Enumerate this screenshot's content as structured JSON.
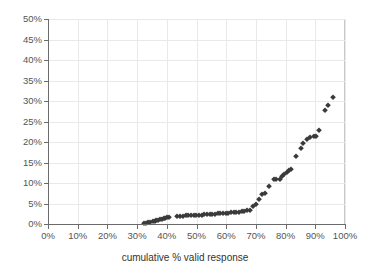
{
  "chart_data": {
    "type": "scatter",
    "title": "",
    "xlabel": "cumulative % valid response",
    "ylabel": "",
    "xlim": [
      0,
      100
    ],
    "ylim": [
      0,
      50
    ],
    "grid": true,
    "legend": null,
    "marker_style": "diamond",
    "marker_color": "#3a3a3a",
    "x_tick_labels": [
      "0%",
      "10%",
      "20%",
      "30%",
      "40%",
      "50%",
      "60%",
      "70%",
      "80%",
      "90%",
      "100%"
    ],
    "x_ticks": [
      0,
      10,
      20,
      30,
      40,
      50,
      60,
      70,
      80,
      90,
      100
    ],
    "y_tick_labels": [
      "0%",
      "5%",
      "10%",
      "15%",
      "20%",
      "25%",
      "30%",
      "35%",
      "40%",
      "45%",
      "50%"
    ],
    "y_ticks": [
      0,
      5,
      10,
      15,
      20,
      25,
      30,
      35,
      40,
      45,
      50
    ],
    "points": [
      [
        32.2,
        0.15
      ],
      [
        33.0,
        0.35
      ],
      [
        33.8,
        0.5
      ],
      [
        34.5,
        0.6
      ],
      [
        35.2,
        0.7
      ],
      [
        35.9,
        0.8
      ],
      [
        36.5,
        0.9
      ],
      [
        37.1,
        1.0
      ],
      [
        37.7,
        1.1
      ],
      [
        38.3,
        1.25
      ],
      [
        38.9,
        1.35
      ],
      [
        39.5,
        1.5
      ],
      [
        40.1,
        1.6
      ],
      [
        40.7,
        1.75
      ],
      [
        43.6,
        1.95
      ],
      [
        44.5,
        2.0
      ],
      [
        45.4,
        2.05
      ],
      [
        46.3,
        2.1
      ],
      [
        47.2,
        2.1
      ],
      [
        48.1,
        2.15
      ],
      [
        49.0,
        2.2
      ],
      [
        49.9,
        2.25
      ],
      [
        50.8,
        2.3
      ],
      [
        51.7,
        2.3
      ],
      [
        52.6,
        2.35
      ],
      [
        53.5,
        2.4
      ],
      [
        54.4,
        2.45
      ],
      [
        55.3,
        2.5
      ],
      [
        56.2,
        2.55
      ],
      [
        57.1,
        2.6
      ],
      [
        58.0,
        2.65
      ],
      [
        58.9,
        2.7
      ],
      [
        59.8,
        2.75
      ],
      [
        60.7,
        2.8
      ],
      [
        61.6,
        2.85
      ],
      [
        62.5,
        2.9
      ],
      [
        63.4,
        2.95
      ],
      [
        64.3,
        3.0
      ],
      [
        65.2,
        3.1
      ],
      [
        66.1,
        3.2
      ],
      [
        67.0,
        3.3
      ],
      [
        67.9,
        3.5
      ],
      [
        69.0,
        4.3
      ],
      [
        70.0,
        5.0
      ],
      [
        71.2,
        6.1
      ],
      [
        72.2,
        7.2
      ],
      [
        72.9,
        7.5
      ],
      [
        74.5,
        9.3
      ],
      [
        76.0,
        10.9
      ],
      [
        76.9,
        11.0
      ],
      [
        78.0,
        11.0
      ],
      [
        78.8,
        11.7
      ],
      [
        79.6,
        12.1
      ],
      [
        80.4,
        12.7
      ],
      [
        81.2,
        13.2
      ],
      [
        81.9,
        13.4
      ],
      [
        83.4,
        16.6
      ],
      [
        85.1,
        18.6
      ],
      [
        86.0,
        19.8
      ],
      [
        87.2,
        20.8
      ],
      [
        88.3,
        21.3
      ],
      [
        89.4,
        21.4
      ],
      [
        90.4,
        21.5
      ],
      [
        91.2,
        23.0
      ],
      [
        93.3,
        27.8
      ],
      [
        94.4,
        29.0
      ],
      [
        96.0,
        31.0
      ]
    ]
  },
  "axis": {
    "x_title": "cumulative % valid response"
  }
}
